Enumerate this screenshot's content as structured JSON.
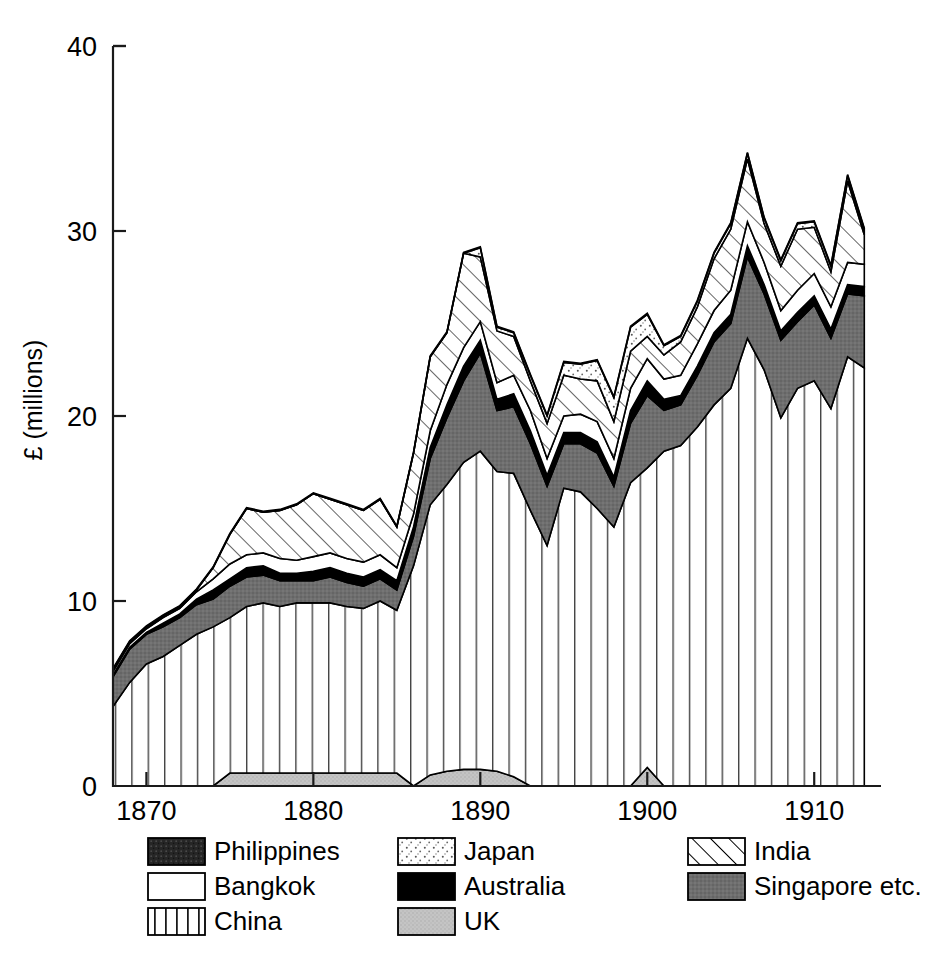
{
  "chart_data": {
    "type": "area",
    "title": "",
    "subtitle": "",
    "xlabel": "",
    "ylabel": "£ (millions)",
    "xlim": [
      1868,
      1914
    ],
    "ylim": [
      0,
      40
    ],
    "yticks": [
      0,
      10,
      20,
      30,
      40
    ],
    "xticks": [
      1870,
      1880,
      1890,
      1900,
      1910
    ],
    "grid": false,
    "legend_position": "bottom",
    "stacked": true,
    "stack_order_bottom_to_top": [
      "UK",
      "China",
      "Singapore etc.",
      "Australia",
      "Bangkok",
      "India",
      "Japan",
      "Philippines"
    ],
    "x": [
      1868,
      1869,
      1870,
      1871,
      1872,
      1873,
      1874,
      1875,
      1876,
      1877,
      1878,
      1879,
      1880,
      1881,
      1882,
      1883,
      1884,
      1885,
      1886,
      1887,
      1888,
      1889,
      1890,
      1891,
      1892,
      1893,
      1894,
      1895,
      1896,
      1897,
      1898,
      1899,
      1900,
      1901,
      1902,
      1903,
      1904,
      1905,
      1906,
      1907,
      1908,
      1909,
      1910,
      1911,
      1912,
      1913
    ],
    "series": [
      {
        "name": "UK",
        "fill": "#c9c9c9",
        "pattern": "light-gray-stipple",
        "values": [
          0,
          0,
          0,
          0,
          0,
          0,
          0,
          0.7,
          0.7,
          0.7,
          0.7,
          0.7,
          0.7,
          0.7,
          0.7,
          0.7,
          0.7,
          0.7,
          0,
          0.6,
          0.8,
          0.9,
          0.9,
          0.8,
          0.5,
          0,
          0,
          0,
          0,
          0,
          0,
          0,
          1.0,
          0,
          0,
          0,
          0,
          0,
          0,
          0,
          0,
          0,
          0,
          0,
          0,
          0
        ]
      },
      {
        "name": "China",
        "fill": "#ffffff",
        "pattern": "vertical-lines",
        "values": [
          4.3,
          5.6,
          6.6,
          7.0,
          7.6,
          8.2,
          8.6,
          8.4,
          9.0,
          9.2,
          9.0,
          9.2,
          9.2,
          9.2,
          9.0,
          8.9,
          9.3,
          8.8,
          11.9,
          14.6,
          15.5,
          16.6,
          17.2,
          16.2,
          16.4,
          14.9,
          13.0,
          16.1,
          15.9,
          15.0,
          14.0,
          16.4,
          16.2,
          18.1,
          18.4,
          19.4,
          20.6,
          21.5,
          24.2,
          22.5,
          19.9,
          21.5,
          21.9,
          20.4,
          23.2,
          22.6
        ]
      },
      {
        "name": "Singapore etc.",
        "fill": "#6b6b6b",
        "pattern": "solid-dark-gray",
        "values": [
          1.6,
          1.8,
          1.6,
          1.6,
          1.5,
          1.6,
          1.5,
          1.7,
          1.6,
          1.5,
          1.4,
          1.2,
          1.2,
          1.4,
          1.3,
          1.2,
          1.2,
          1.1,
          1.6,
          2.5,
          3.6,
          4.4,
          5.3,
          3.3,
          3.6,
          3.6,
          3.2,
          2.4,
          2.6,
          3.0,
          2.2,
          3.2,
          3.9,
          2.2,
          2.2,
          2.8,
          3.4,
          3.5,
          4.4,
          4.1,
          4.2,
          3.6,
          4.1,
          3.8,
          3.4,
          3.9
        ]
      },
      {
        "name": "Australia",
        "fill": "#000000",
        "pattern": "solid-black",
        "values": [
          0.1,
          0.1,
          0.1,
          0.2,
          0.2,
          0.3,
          0.5,
          0.4,
          0.5,
          0.5,
          0.4,
          0.4,
          0.5,
          0.5,
          0.5,
          0.5,
          0.5,
          0.5,
          0.5,
          0.6,
          0.7,
          0.8,
          0.7,
          0.6,
          0.7,
          0.7,
          0.6,
          0.6,
          0.6,
          0.6,
          0.5,
          0.7,
          0.8,
          0.6,
          0.5,
          0.5,
          0.5,
          0.5,
          0.6,
          0.5,
          0.5,
          0.5,
          0.5,
          0.5,
          0.5,
          0.5
        ]
      },
      {
        "name": "Bangkok",
        "fill": "#ffffff",
        "pattern": "white-empty",
        "values": [
          0.2,
          0.2,
          0.2,
          0.3,
          0.3,
          0.4,
          0.6,
          0.8,
          0.7,
          0.7,
          0.8,
          0.7,
          0.8,
          0.8,
          0.8,
          0.8,
          0.8,
          0.7,
          0.7,
          0.9,
          1.1,
          1.0,
          1.0,
          0.9,
          1.0,
          1.1,
          0.9,
          0.9,
          1.0,
          1.1,
          1.0,
          1.2,
          1.2,
          1.1,
          1.1,
          1.2,
          1.2,
          1.3,
          1.3,
          1.2,
          1.1,
          1.2,
          1.2,
          1.2,
          1.2,
          1.2
        ]
      },
      {
        "name": "India",
        "fill": "#ffffff",
        "pattern": "diagonal-hatch",
        "values": [
          0.1,
          0.1,
          0.1,
          0.1,
          0.1,
          0.1,
          0.6,
          1.6,
          2.5,
          2.2,
          2.6,
          3.0,
          3.4,
          2.9,
          2.9,
          2.8,
          3.0,
          2.2,
          3.3,
          4.0,
          2.8,
          5.1,
          3.5,
          2.8,
          2.1,
          1.6,
          1.9,
          2.2,
          1.9,
          2.2,
          2.0,
          2.0,
          1.2,
          1.3,
          1.8,
          2.0,
          2.8,
          3.3,
          3.4,
          2.1,
          2.4,
          3.3,
          2.5,
          1.9,
          4.4,
          1.6
        ]
      },
      {
        "name": "Japan",
        "fill": "#f2f2f2",
        "pattern": "stipple-dots",
        "values": [
          0,
          0,
          0,
          0,
          0,
          0,
          0,
          0,
          0,
          0,
          0,
          0,
          0,
          0,
          0,
          0,
          0,
          0,
          0,
          0,
          0,
          0,
          0.5,
          0.2,
          0.2,
          0.3,
          0.4,
          0.7,
          0.8,
          1.1,
          1.3,
          1.3,
          1.2,
          0.5,
          0.3,
          0.3,
          0.3,
          0.3,
          0.3,
          0.3,
          0.3,
          0.3,
          0.3,
          0.3,
          0.3,
          0.3
        ]
      },
      {
        "name": "Philippines",
        "fill": "#2b2b2b",
        "pattern": "dark-textured",
        "values": [
          0.05,
          0.05,
          0.05,
          0.05,
          0.05,
          0.05,
          0.05,
          0.05,
          0.05,
          0.05,
          0.05,
          0.05,
          0.05,
          0.05,
          0.05,
          0.05,
          0.05,
          0.05,
          0.05,
          0.05,
          0.05,
          0.05,
          0.05,
          0.05,
          0.05,
          0.05,
          0.05,
          0.05,
          0.05,
          0.05,
          0.05,
          0.05,
          0.05,
          0.05,
          0.05,
          0.05,
          0.05,
          0.05,
          0.05,
          0.05,
          0.05,
          0.05,
          0.05,
          0.05,
          0.05,
          0.05
        ]
      }
    ]
  },
  "axes": {
    "y_title": "£ (millions)",
    "y_ticks": [
      "0",
      "10",
      "20",
      "30",
      "40"
    ],
    "x_ticks": [
      "1870",
      "1880",
      "1890",
      "1900",
      "1910"
    ]
  },
  "legend": {
    "columns": [
      {
        "items": [
          {
            "label": "Philippines",
            "swatch": "dark-textured-swatch"
          },
          {
            "label": "Bangkok",
            "swatch": "white-empty-swatch"
          },
          {
            "label": "China",
            "swatch": "vertical-lines-swatch"
          }
        ]
      },
      {
        "items": [
          {
            "label": "Japan",
            "swatch": "stipple-dots-swatch"
          },
          {
            "label": "Australia",
            "swatch": "solid-black-swatch"
          },
          {
            "label": "UK",
            "swatch": "light-gray-swatch"
          }
        ]
      },
      {
        "items": [
          {
            "label": "India",
            "swatch": "diagonal-hatch-swatch"
          },
          {
            "label": "Singapore etc.",
            "swatch": "dark-gray-swatch"
          }
        ]
      }
    ]
  },
  "colors": {
    "axis": "#1a1a1a",
    "china": "#ffffff",
    "singapore": "#6b6b6b",
    "australia": "#000000",
    "bangkok": "#ffffff",
    "india": "#ffffff",
    "japan": "#f2f2f2",
    "uk": "#c9c9c9",
    "philippines": "#2b2b2b"
  }
}
